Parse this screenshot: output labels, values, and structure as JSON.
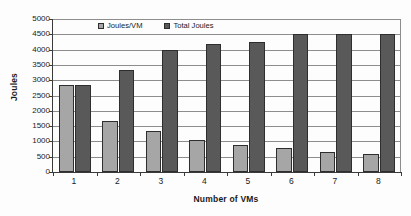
{
  "chart_data": {
    "type": "bar",
    "title": "",
    "xlabel": "Number of VMs",
    "ylabel": "Joules",
    "categories": [
      "1",
      "2",
      "3",
      "4",
      "5",
      "6",
      "7",
      "8"
    ],
    "series": [
      {
        "name": "Joules/VM",
        "color": "#a6a6a6",
        "values": [
          2850,
          1680,
          1350,
          1060,
          870,
          780,
          660,
          580
        ]
      },
      {
        "name": "Total Joules",
        "color": "#595959",
        "values": [
          2850,
          3340,
          4000,
          4170,
          4250,
          4510,
          4520,
          4520
        ]
      }
    ],
    "ylim": [
      0,
      5000
    ],
    "ytick_step": 500,
    "yticks": [
      "0",
      "500",
      "1000",
      "1500",
      "2000",
      "2500",
      "3000",
      "3500",
      "4000",
      "4500",
      "5000"
    ],
    "grid": true,
    "legend_position": "top-inside"
  }
}
